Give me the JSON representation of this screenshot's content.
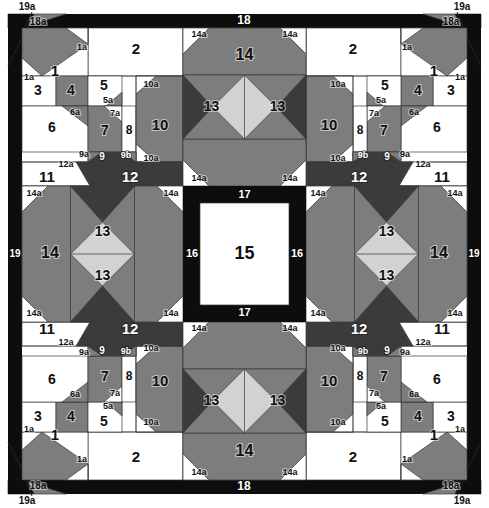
{
  "diagram": {
    "type": "pieced-quilt-block-layout",
    "canvas": {
      "width": 489,
      "height": 508
    },
    "colors": {
      "background": "#ffffff",
      "light": "#ffffff",
      "light_gray": "#d2d2d2",
      "medium_gray": "#7d7d7d",
      "dark_gray": "#3b3b3b",
      "black": "#0d0d0d",
      "outline": "#3a3a3a",
      "label_dark": "#111111",
      "label_light": "#ffffff"
    },
    "symmetry": "4-way mirrored (corner blocks mirrored horizontally and vertically); side units rotated 90 degrees",
    "piece_legend": [
      {
        "id": "1",
        "shape": "trapezoid",
        "fabric": "medium_gray"
      },
      {
        "id": "1a",
        "shape": "corner-triangle",
        "fabric": "light"
      },
      {
        "id": "2",
        "shape": "rectangle",
        "fabric": "light"
      },
      {
        "id": "3",
        "shape": "square",
        "fabric": "light"
      },
      {
        "id": "4",
        "shape": "square",
        "fabric": "medium_gray"
      },
      {
        "id": "5",
        "shape": "square",
        "fabric": "light"
      },
      {
        "id": "5a",
        "shape": "corner-triangle",
        "fabric": "medium_gray"
      },
      {
        "id": "6",
        "shape": "square",
        "fabric": "light"
      },
      {
        "id": "6a",
        "shape": "corner-triangle",
        "fabric": "medium_gray"
      },
      {
        "id": "7",
        "shape": "square",
        "fabric": "medium_gray"
      },
      {
        "id": "7a",
        "shape": "corner-triangle",
        "fabric": "light"
      },
      {
        "id": "8",
        "shape": "rectangle",
        "fabric": "light"
      },
      {
        "id": "9",
        "shape": "rectangle",
        "fabric": "dark_gray"
      },
      {
        "id": "9a",
        "shape": "corner-triangle",
        "fabric": "medium_gray"
      },
      {
        "id": "9b",
        "shape": "corner-triangle",
        "fabric": "medium_gray"
      },
      {
        "id": "10",
        "shape": "octagon-corner",
        "fabric": "medium_gray"
      },
      {
        "id": "10a",
        "shape": "corner-triangle",
        "fabric": "light"
      },
      {
        "id": "11",
        "shape": "square",
        "fabric": "light"
      },
      {
        "id": "12",
        "shape": "trapezoid",
        "fabric": "dark_gray"
      },
      {
        "id": "12a",
        "shape": "corner-triangle",
        "fabric": "light"
      },
      {
        "id": "13",
        "shape": "hourglass-quarter",
        "fabric": "dark_gray / light_gray"
      },
      {
        "id": "14",
        "shape": "octagon-half",
        "fabric": "medium_gray"
      },
      {
        "id": "14a",
        "shape": "corner-triangle",
        "fabric": "light"
      },
      {
        "id": "15",
        "shape": "center-square",
        "fabric": "light"
      },
      {
        "id": "16",
        "shape": "border-strip-side",
        "fabric": "black"
      },
      {
        "id": "17",
        "shape": "border-strip-topbottom",
        "fabric": "black"
      },
      {
        "id": "18",
        "shape": "outer-border-topbottom",
        "fabric": "black"
      },
      {
        "id": "18a",
        "shape": "corner-triangle",
        "fabric": "medium_gray"
      },
      {
        "id": "19",
        "shape": "outer-border-side",
        "fabric": "black"
      },
      {
        "id": "19a",
        "shape": "corner-triangle",
        "fabric": "black"
      }
    ],
    "labels": {
      "p1": "1",
      "p1a": "1a",
      "p2": "2",
      "p3": "3",
      "p4": "4",
      "p5": "5",
      "p5a": "5a",
      "p6": "6",
      "p6a": "6a",
      "p7": "7",
      "p7a": "7a",
      "p8": "8",
      "p9": "9",
      "p9a": "9a",
      "p9b": "9b",
      "p10": "10",
      "p10a": "10a",
      "p11": "11",
      "p12": "12",
      "p12a": "12a",
      "p13": "13",
      "p14": "14",
      "p14a": "14a",
      "p15": "15",
      "p16": "16",
      "p17": "17",
      "p18": "18",
      "p18a": "18a",
      "p19": "19",
      "p19a": "19a"
    }
  }
}
